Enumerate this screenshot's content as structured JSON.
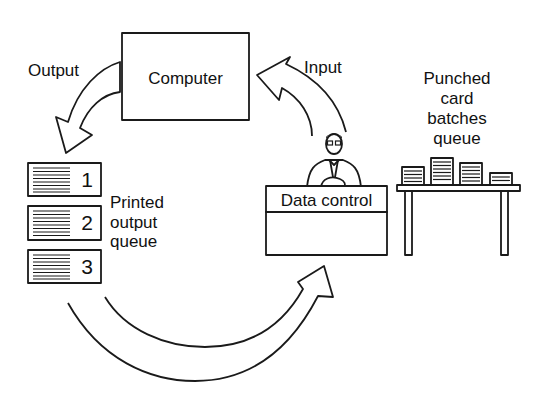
{
  "diagram": {
    "type": "batch-processing-cycle",
    "nodes": {
      "computer": {
        "label": "Computer"
      },
      "data_control": {
        "label": "Data control"
      },
      "printed_output_queue": {
        "label_lines": [
          "Printed",
          "output",
          "queue"
        ],
        "items": [
          "1",
          "2",
          "3"
        ]
      },
      "punched_card_queue": {
        "label_lines": [
          "Punched",
          "card",
          "batches",
          "queue"
        ],
        "batch_count": 4
      }
    },
    "edges": [
      {
        "from": "computer",
        "to": "printed_output_queue",
        "label": "Output"
      },
      {
        "from": "data_control",
        "to": "computer",
        "label": "Input"
      },
      {
        "from": "printed_output_queue",
        "to": "data_control",
        "label": ""
      }
    ],
    "colors": {
      "ink": "#1a1a1a",
      "background": "#ffffff"
    }
  }
}
